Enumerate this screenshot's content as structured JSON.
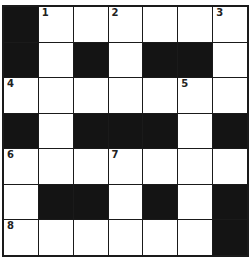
{
  "puzzle": {
    "rows": 7,
    "cols": 7,
    "grid": [
      [
        "#",
        "1",
        ".",
        "2",
        ".",
        ".",
        "3"
      ],
      [
        "#",
        ".",
        "#",
        ".",
        "#",
        "#",
        "."
      ],
      [
        "4",
        ".",
        ".",
        ".",
        ".",
        "5",
        "."
      ],
      [
        "#",
        ".",
        "#",
        "#",
        "#",
        ".",
        "#"
      ],
      [
        "6",
        ".",
        ".",
        "7",
        ".",
        ".",
        "."
      ],
      [
        ".",
        "#",
        "#",
        ".",
        "#",
        ".",
        "#"
      ],
      [
        "8",
        ".",
        ".",
        ".",
        ".",
        ".",
        "#"
      ]
    ],
    "colors": {
      "block": "#141414",
      "cell": "#ffffff",
      "line": "#1a1a1a"
    }
  }
}
